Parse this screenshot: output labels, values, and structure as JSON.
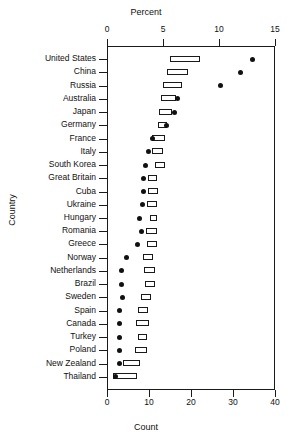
{
  "chart_data": {
    "type": "bar",
    "title": "",
    "xlabel": "Count",
    "ylabel": "Country",
    "top_axis_label": "Percent",
    "bottom_axis_label": "Count",
    "count_ticks": [
      0,
      10,
      20,
      30,
      40
    ],
    "percent_ticks": [
      0,
      5,
      10,
      15
    ],
    "xlim_count": [
      0,
      40
    ],
    "xlim_percent": [
      0,
      15
    ],
    "grid": false,
    "legend": "none",
    "series_names": [
      "count_range_bar",
      "percent_point"
    ],
    "categories": [
      "United States",
      "China",
      "Russia",
      "Australia",
      "Japan",
      "Germany",
      "France",
      "Italy",
      "South Korea",
      "Great Britain",
      "Cuba",
      "Ukraine",
      "Hungary",
      "Romania",
      "Greece",
      "Norway",
      "Netherlands",
      "Brazil",
      "Sweden",
      "Spain",
      "Canada",
      "Turkey",
      "Poland",
      "New Zealand",
      "Thailand"
    ],
    "rows": [
      {
        "country": "United States",
        "count_low": 15.0,
        "count_high": 22.1,
        "percent": 13.0
      },
      {
        "country": "China",
        "count_low": 14.3,
        "count_high": 19.3,
        "percent": 11.9
      },
      {
        "country": "Russia",
        "count_low": 13.3,
        "count_high": 17.9,
        "percent": 10.1
      },
      {
        "country": "Australia",
        "count_low": 12.9,
        "count_high": 16.4,
        "percent": 6.3
      },
      {
        "country": "Japan",
        "count_low": 12.4,
        "count_high": 15.5,
        "percent": 6.0
      },
      {
        "country": "Germany",
        "count_low": 12.1,
        "count_high": 14.3,
        "percent": 5.3
      },
      {
        "country": "France",
        "count_low": 10.7,
        "count_high": 13.8,
        "percent": 4.1
      },
      {
        "country": "Italy",
        "count_low": 10.7,
        "count_high": 13.3,
        "percent": 3.7
      },
      {
        "country": "South Korea",
        "count_low": 11.4,
        "count_high": 13.8,
        "percent": 3.4
      },
      {
        "country": "Great Britain",
        "count_low": 9.8,
        "count_high": 11.9,
        "percent": 3.3
      },
      {
        "country": "Cuba",
        "count_low": 9.8,
        "count_high": 12.1,
        "percent": 3.3
      },
      {
        "country": "Ukraine",
        "count_low": 9.5,
        "count_high": 11.9,
        "percent": 3.2
      },
      {
        "country": "Hungary",
        "count_low": 10.2,
        "count_high": 11.9,
        "percent": 2.9
      },
      {
        "country": "Romania",
        "count_low": 9.3,
        "count_high": 11.9,
        "percent": 3.1
      },
      {
        "country": "Greece",
        "count_low": 9.5,
        "count_high": 11.9,
        "percent": 2.7
      },
      {
        "country": "Norway",
        "count_low": 8.6,
        "count_high": 11.0,
        "percent": 1.7
      },
      {
        "country": "Netherlands",
        "count_low": 8.8,
        "count_high": 11.4,
        "percent": 1.3
      },
      {
        "country": "Brazil",
        "count_low": 9.0,
        "count_high": 11.4,
        "percent": 1.3
      },
      {
        "country": "Sweden",
        "count_low": 8.1,
        "count_high": 10.5,
        "percent": 1.4
      },
      {
        "country": "Spain",
        "count_low": 7.4,
        "count_high": 9.8,
        "percent": 1.1
      },
      {
        "country": "Canada",
        "count_low": 6.9,
        "count_high": 10.0,
        "percent": 1.1
      },
      {
        "country": "Turkey",
        "count_low": 7.4,
        "count_high": 9.5,
        "percent": 1.1
      },
      {
        "country": "Poland",
        "count_low": 6.7,
        "count_high": 9.5,
        "percent": 1.1
      },
      {
        "country": "New Zealand",
        "count_low": 3.8,
        "count_high": 7.9,
        "percent": 1.1
      },
      {
        "country": "Thailand",
        "count_low": 1.4,
        "count_high": 7.1,
        "percent": 0.8
      }
    ]
  }
}
